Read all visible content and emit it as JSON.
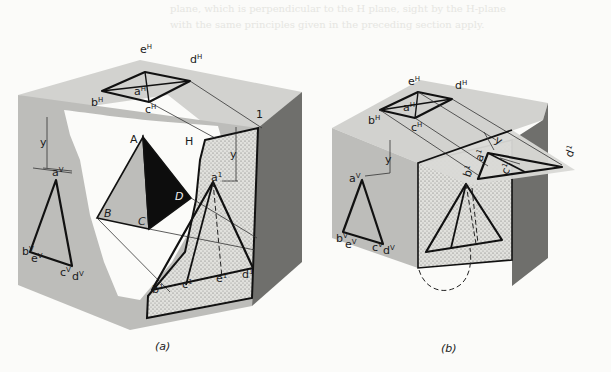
{
  "background_text": {
    "line_1": "plane, which is perpendicular to the H plane, sight by the H-plane",
    "line_2": "with the same principles given in the preceding section apply."
  },
  "figure_a": {
    "caption": "(a)",
    "horizontal_labels": {
      "e": "e",
      "d": "d",
      "b": "b",
      "a": "a",
      "c": "c",
      "sup": "H"
    },
    "frontal_labels": {
      "a": "a",
      "b": "b",
      "e": "e",
      "c": "c",
      "d": "d",
      "sup": "V"
    },
    "profile_labels": {
      "a": "a",
      "b": "b",
      "c": "c",
      "e": "e",
      "d": "d",
      "sup": "1"
    },
    "pyramid_labels": {
      "A": "A",
      "B": "B",
      "C": "C",
      "D": "D"
    },
    "plane_labels": {
      "H": "H",
      "one": "1"
    },
    "dimension_front": "y",
    "dimension_aux": "y"
  },
  "figure_b": {
    "caption": "(b)",
    "horizontal_labels": {
      "e": "e",
      "d": "d",
      "b": "b",
      "a": "a",
      "c": "c",
      "sup": "H"
    },
    "frontal_labels": {
      "a": "a",
      "b": "b",
      "e": "e",
      "c": "c",
      "d": "d",
      "sup": "V"
    },
    "aux_labels": {
      "b": "b",
      "a": "a",
      "c": "c",
      "d": "d",
      "sup": "1"
    },
    "dimension_front": "y",
    "dimension_aux": "y"
  },
  "colors": {
    "top_face": "#d2d2cf",
    "front_face": "#bdbdba",
    "side_face": "#6f6f6c",
    "stipple_face": "#dcdcd8",
    "cutout": "#fbfbf9",
    "pyramid_dark": "#0d0d0d",
    "pyramid_mid": "#bdbdba",
    "ink": "#111111"
  }
}
